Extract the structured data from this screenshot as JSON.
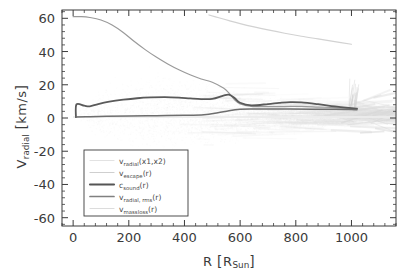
{
  "chart_data": {
    "type": "line",
    "title": "",
    "xlabel": "R [R_Sun]",
    "ylabel": "V_radial [km/s]",
    "xlim": [
      -40,
      1160
    ],
    "ylim": [
      -65,
      65
    ],
    "xticks": [
      0,
      200,
      400,
      600,
      800,
      1000
    ],
    "yticks": [
      60,
      40,
      20,
      0,
      -20,
      -40,
      -60
    ],
    "xtick_labels": [
      "0",
      "200",
      "400",
      "600",
      "800",
      "1000"
    ],
    "ytick_labels": [
      "60",
      "40",
      "20",
      "0",
      "-20",
      "-40",
      "-60"
    ],
    "minor_ticks_per_major": 4,
    "grid": false,
    "legend_position": "lower-left",
    "axis_color": "#3b3b3b",
    "background": "#ffffff",
    "series": [
      {
        "name": "v_radial(x1,x2)",
        "label_base": "v",
        "label_sub": "radial",
        "label_arg": "(x1,x2)",
        "kind": "scatter-cloud",
        "color": "#e2e2e2",
        "width": 1,
        "description": "light grey scatter cloud of individual ray velocities, envelope roughly -22..+32 km/s between R=50 and R=500, narrowing and streaking into filaments beyond R=600 out to R=1160"
      },
      {
        "name": "v_escape(r)",
        "label_base": "v",
        "label_sub": "escape",
        "label_arg": "(r)",
        "kind": "line",
        "color": "#9a9a9a",
        "width": 1.2,
        "x": [
          0,
          30,
          60,
          100,
          140,
          180,
          220,
          260,
          300,
          340,
          380,
          420,
          460,
          500,
          540,
          560,
          580,
          600,
          640,
          700,
          760,
          820,
          880,
          940,
          1000
        ],
        "y": [
          61,
          61,
          60.5,
          59,
          56,
          51.5,
          46,
          41,
          36.5,
          32.5,
          29,
          26,
          23.5,
          21.5,
          18,
          15,
          11,
          8.5,
          7,
          6.8,
          6.9,
          7,
          6.6,
          6.2,
          5.6
        ]
      },
      {
        "name": "c_sound(r)",
        "label_base": "c",
        "label_sub": "sound",
        "label_arg": "(r)",
        "kind": "line",
        "color": "#5a5a5a",
        "width": 1.8,
        "x": [
          10,
          12,
          40,
          60,
          90,
          130,
          180,
          230,
          280,
          330,
          380,
          420,
          460,
          500,
          540,
          560,
          580,
          600,
          640,
          700,
          740,
          780,
          820,
          880,
          940,
          1000,
          1020
        ],
        "y": [
          0.5,
          8.2,
          7.4,
          7.0,
          8.4,
          9.8,
          11.0,
          11.9,
          12.4,
          12.6,
          12.3,
          11.8,
          11.4,
          11.5,
          13.5,
          14.0,
          12.0,
          9.2,
          7.6,
          8.4,
          9.1,
          9.6,
          9.4,
          8.3,
          7.0,
          5.9,
          5.6
        ]
      },
      {
        "name": "v_radial,rms(r)",
        "label_base": "v",
        "label_sub": "radial, rms",
        "label_arg": "(r)",
        "kind": "line",
        "color": "#6e6e6e",
        "width": 1.5,
        "x": [
          10,
          60,
          120,
          200,
          300,
          400,
          470,
          520,
          560,
          600,
          640,
          700,
          780,
          860,
          940,
          1000,
          1020
        ],
        "y": [
          0.6,
          0.8,
          1.0,
          1.2,
          1.4,
          1.6,
          2.0,
          3.2,
          4.4,
          5.2,
          5.4,
          5.4,
          5.4,
          5.3,
          5.2,
          5.1,
          5.0
        ]
      },
      {
        "name": "v_massloss(r)",
        "label_base": "v",
        "label_sub": "massloss",
        "label_arg": "(r)",
        "kind": "line",
        "color": "#d2d2d2",
        "width": 1.2,
        "x": [
          488,
          520,
          560,
          600,
          650,
          700,
          760,
          820,
          880,
          940,
          1000
        ],
        "y": [
          62,
          60.5,
          58.6,
          56.8,
          54.8,
          53.0,
          51.0,
          49.2,
          47.6,
          46.0,
          44.4
        ]
      }
    ],
    "legend_entries": [
      {
        "base": "v",
        "sub": "radial",
        "arg": "(x1,x2)",
        "color": "#e2e2e2",
        "width": 1.2
      },
      {
        "base": "v",
        "sub": "escape",
        "arg": "(r)",
        "color": "#cfcfcf",
        "width": 1.2
      },
      {
        "base": "c",
        "sub": "sound",
        "arg": "(r)",
        "color": "#555555",
        "width": 2.1
      },
      {
        "base": "v",
        "sub": "radial, rms",
        "arg": "(r)",
        "color": "#808080",
        "width": 1.7
      },
      {
        "base": "v",
        "sub": "massloss",
        "arg": "(r)",
        "color": "#dcdcdc",
        "width": 1.2
      }
    ]
  },
  "axis": {
    "xlabel_main": "R",
    "xlabel_unit": "R",
    "xlabel_unit_sub": "Sun",
    "ylabel_main": "V",
    "ylabel_main_sub": "radial",
    "ylabel_unit": "km/s"
  }
}
